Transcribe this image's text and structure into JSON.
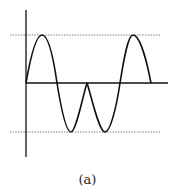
{
  "figure": {
    "caption": "(a)",
    "colors": {
      "stroke": "#111111",
      "dashed": "#666666",
      "background": "#ffffff"
    },
    "axes": {
      "vertical": {
        "x": 26,
        "y1": 10,
        "y2": 157
      },
      "horizontal": {
        "y": 83,
        "x1": 26,
        "x2": 168
      }
    },
    "reference_lines": [
      {
        "name": "positive-peak-level",
        "y": 35,
        "x1": 10,
        "x2": 160,
        "style": "dashed"
      },
      {
        "name": "negative-peak-level",
        "y": 132,
        "x1": 10,
        "x2": 160,
        "style": "dashed"
      }
    ],
    "waveform_points": [
      [
        26,
        83
      ],
      [
        42,
        35
      ],
      [
        57,
        83
      ],
      [
        71,
        132
      ],
      [
        87,
        83
      ],
      [
        105,
        132
      ],
      [
        120,
        83
      ],
      [
        133,
        35
      ],
      [
        151,
        83
      ]
    ]
  }
}
